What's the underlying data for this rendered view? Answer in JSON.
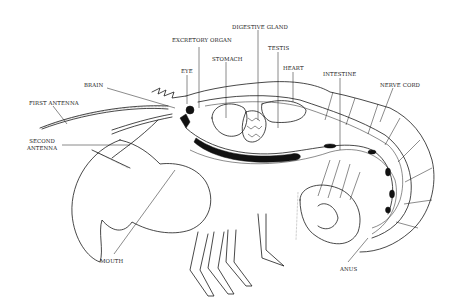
{
  "diagram": {
    "labels": [
      {
        "id": "excretory-organ",
        "text": "EXCRETORY ORGAN",
        "x": 172,
        "y": 37
      },
      {
        "id": "digestive-gland",
        "text": "DIGESTIVE GLAND",
        "x": 232,
        "y": 24
      },
      {
        "id": "testis",
        "text": "TESTIS",
        "x": 268,
        "y": 45
      },
      {
        "id": "stomach",
        "text": "STOMACH",
        "x": 212,
        "y": 56
      },
      {
        "id": "heart",
        "text": "HEART",
        "x": 283,
        "y": 65
      },
      {
        "id": "intestine",
        "text": "INTESTINE",
        "x": 323,
        "y": 71
      },
      {
        "id": "eye",
        "text": "EYE",
        "x": 181,
        "y": 68
      },
      {
        "id": "brain",
        "text": "BRAIN",
        "x": 84,
        "y": 82
      },
      {
        "id": "nerve-cord",
        "text": "NERVE CORD",
        "x": 380,
        "y": 82
      },
      {
        "id": "first-antenna",
        "text": "FIRST ANTENNA",
        "x": 29,
        "y": 100
      },
      {
        "id": "second-antenna",
        "text": "SECOND\nANTENNA",
        "x": 27,
        "y": 138
      },
      {
        "id": "mouth",
        "text": "MOUTH",
        "x": 100,
        "y": 258
      },
      {
        "id": "anus",
        "text": "ANUS",
        "x": 340,
        "y": 266
      }
    ]
  }
}
